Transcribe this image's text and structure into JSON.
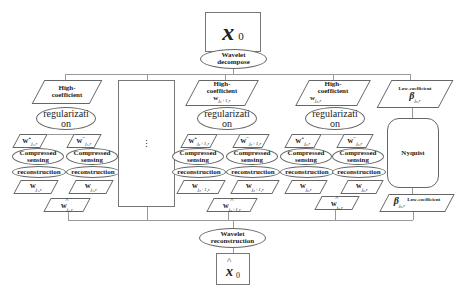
{
  "input": {
    "symbol": "x",
    "subscript": "0"
  },
  "decompose": {
    "label": "Wavelet decompose"
  },
  "reconstruct": {
    "label": "Wavelet reconstruction"
  },
  "output": {
    "symbol": "x",
    "subscript": "0",
    "hat": "^"
  },
  "ellipsis": "⋮",
  "branches": [
    {
      "coeff_label": "High-coefficient",
      "coeff_symbol": "",
      "coeff_sub": "j₁,r",
      "regularization": "regularization",
      "w_plus": "w",
      "w_plus_sub": "j₁,r",
      "w_minus": "w",
      "w_minus_sub": "j₁,r",
      "cs_label": "Compressed sensing",
      "recon_label": "reconstruction",
      "w_rec_left": "w",
      "w_rec_left_sub": "j₁,r",
      "w_rec_right": "w",
      "w_rec_right_sub": "j₁,r",
      "w_final": "w",
      "w_final_sub": "j₁,r"
    },
    {
      "coeff_label": "High-coefficient",
      "coeff_symbol": "w",
      "coeff_sub": "j₀+1,r",
      "regularization": "regularization",
      "w_plus": "w",
      "w_plus_sub": "j₀+1,r",
      "w_minus": "w",
      "w_minus_sub": "j₀+1,r",
      "cs_label": "Compressed sensing",
      "recon_label": "reconstruction",
      "w_rec_left": "w",
      "w_rec_left_sub": "j₀+1,r",
      "w_rec_right": "w",
      "w_rec_right_sub": "j₀+1,r",
      "w_final": "w",
      "w_final_sub": "j₀+1,r"
    },
    {
      "coeff_label": "High-coefficient",
      "coeff_symbol": "w",
      "coeff_sub": "j₀,r",
      "regularization": "regularization",
      "w_plus": "w",
      "w_plus_sub": "j₀,r",
      "w_minus": "w",
      "w_minus_sub": "j₀,r",
      "cs_label": "Compressed sensing",
      "recon_label": "reconstruction",
      "w_rec_left": "w",
      "w_rec_left_sub": "j₀,r",
      "w_rec_right": "w",
      "w_rec_right_sub": "j₀,r",
      "w_final": "w",
      "w_final_sub": "j₀,r"
    }
  ],
  "low": {
    "in_label": "Low-coefficient",
    "in_symbol": "β",
    "in_sub": "j₀,r",
    "nyquist": "Nyquist",
    "out_label": "Low-coefficient",
    "out_symbol": "β",
    "out_sub": "j₀,r"
  }
}
